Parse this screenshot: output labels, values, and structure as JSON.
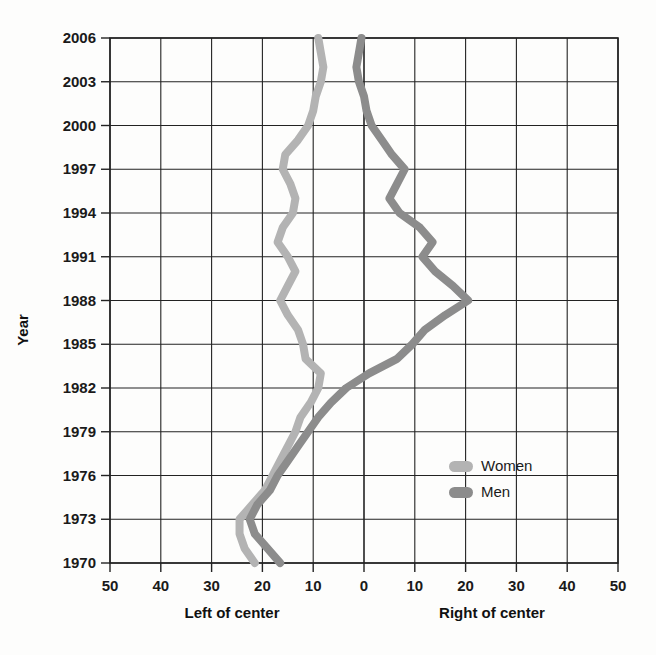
{
  "chart_data": {
    "type": "line",
    "title": "",
    "subtitle": "",
    "orientation": "horizontal-value-vertical-year",
    "xlabel_left": "Left of center",
    "xlabel_right": "Right of center",
    "ylabel": "Year",
    "xticks": [
      50,
      40,
      30,
      20,
      10,
      0,
      10,
      20,
      30,
      40,
      50
    ],
    "xtick_labels": [
      "50",
      "40",
      "30",
      "20",
      "10",
      "0",
      "10",
      "20",
      "30",
      "40",
      "50"
    ],
    "xlim": [
      -50,
      50
    ],
    "yticks": [
      1970,
      1973,
      1976,
      1979,
      1982,
      1985,
      1988,
      1991,
      1994,
      1997,
      2000,
      2003,
      2006
    ],
    "ytick_labels": [
      "1970",
      "1973",
      "1976",
      "1979",
      "1982",
      "1985",
      "1988",
      "1991",
      "1994",
      "1997",
      "2000",
      "2003",
      "2006"
    ],
    "ylim": [
      1970,
      2006
    ],
    "grid": true,
    "legend_position": "inside-right-lower",
    "legend": [
      "Women",
      "Men"
    ],
    "note_negative_is_left_of_center": true,
    "series": [
      {
        "name": "Women",
        "color": "#b3b3b3",
        "x": [
          -21.5,
          -23.5,
          -24.5,
          -24.5,
          -22.0,
          -19.5,
          -18.0,
          -16.5,
          -15.0,
          -13.5,
          -12.5,
          -10.5,
          -9.0,
          -8.5,
          -11.5,
          -12.0,
          -13.0,
          -15.0,
          -16.5,
          -15.0,
          -13.5,
          -15.0,
          -17.0,
          -16.0,
          -14.0,
          -13.5,
          -14.5,
          -16.0,
          -15.5,
          -13.0,
          -11.0,
          -10.0,
          -9.5,
          -8.5,
          -8.0,
          -8.5,
          -9.0
        ],
        "years": [
          1970,
          1971,
          1972,
          1973,
          1974,
          1975,
          1976,
          1977,
          1978,
          1979,
          1980,
          1981,
          1982,
          1983,
          1984,
          1985,
          1986,
          1987,
          1988,
          1989,
          1990,
          1991,
          1992,
          1993,
          1994,
          1995,
          1996,
          1997,
          1998,
          1999,
          2000,
          2001,
          2002,
          2003,
          2004,
          2005,
          2006
        ]
      },
      {
        "name": "Men",
        "color": "#8c8c8c",
        "x": [
          -16.5,
          -19.0,
          -21.5,
          -22.5,
          -21.0,
          -18.5,
          -17.0,
          -15.0,
          -13.0,
          -11.0,
          -9.0,
          -6.5,
          -3.5,
          1.0,
          6.5,
          9.5,
          12.0,
          16.0,
          20.5,
          17.5,
          14.0,
          11.5,
          13.5,
          11.0,
          7.0,
          5.0,
          6.5,
          8.0,
          5.5,
          3.5,
          1.5,
          0.5,
          0.0,
          -1.0,
          -1.5,
          -1.0,
          -0.5
        ],
        "years": [
          1970,
          1971,
          1972,
          1973,
          1974,
          1975,
          1976,
          1977,
          1978,
          1979,
          1980,
          1981,
          1982,
          1983,
          1984,
          1985,
          1986,
          1987,
          1988,
          1989,
          1990,
          1991,
          1992,
          1993,
          1994,
          1995,
          1996,
          1997,
          1998,
          1999,
          2000,
          2001,
          2002,
          2003,
          2004,
          2005,
          2006
        ]
      }
    ]
  },
  "legend": {
    "women_label": "Women",
    "men_label": "Men",
    "women_color": "#b3b3b3",
    "men_color": "#8c8c8c"
  },
  "axes": {
    "y_title": "Year",
    "x_title_left": "Left of center",
    "x_title_right": "Right of center"
  }
}
